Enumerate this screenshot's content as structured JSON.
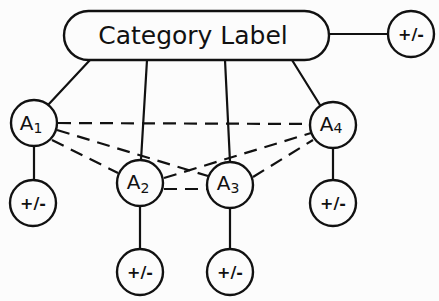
{
  "diagram": {
    "category": {
      "label": "Category Label",
      "modifier": "+/-"
    },
    "nodes": [
      {
        "id": "A1",
        "letter": "A",
        "subscript": "1",
        "modifier": "+/-"
      },
      {
        "id": "A2",
        "letter": "A",
        "subscript": "2",
        "modifier": "+/-"
      },
      {
        "id": "A3",
        "letter": "A",
        "subscript": "3",
        "modifier": "+/-"
      },
      {
        "id": "A4",
        "letter": "A",
        "subscript": "4",
        "modifier": "+/-"
      }
    ],
    "solid_edges": [
      [
        "Category",
        "Category-modifier"
      ],
      [
        "Category",
        "A1"
      ],
      [
        "Category",
        "A2"
      ],
      [
        "Category",
        "A3"
      ],
      [
        "Category",
        "A4"
      ],
      [
        "A1",
        "A1-modifier"
      ],
      [
        "A2",
        "A2-modifier"
      ],
      [
        "A3",
        "A3-modifier"
      ],
      [
        "A4",
        "A4-modifier"
      ]
    ],
    "dashed_edges": [
      [
        "A1",
        "A4"
      ],
      [
        "A1",
        "A3"
      ],
      [
        "A1",
        "A2"
      ],
      [
        "A2",
        "A4"
      ],
      [
        "A2",
        "A3"
      ],
      [
        "A3",
        "A4"
      ]
    ]
  }
}
